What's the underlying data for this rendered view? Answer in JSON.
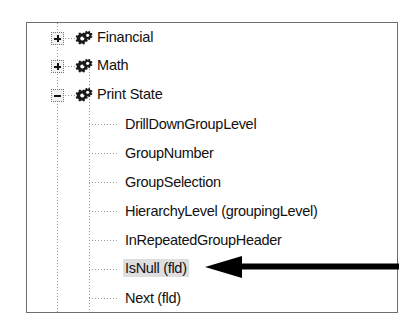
{
  "panel": {
    "name": "function-tree",
    "border_color": "#6e6e6e",
    "background": "#ffffff"
  },
  "tree": {
    "groups": [
      {
        "label": "Financial",
        "expanded": false,
        "expander": "plus",
        "icon": "gear-icon",
        "children": []
      },
      {
        "label": "Math",
        "expanded": false,
        "expander": "plus",
        "icon": "gear-icon",
        "children": []
      },
      {
        "label": "Print State",
        "expanded": true,
        "expander": "minus",
        "icon": "gear-icon",
        "children": [
          {
            "label": "DrillDownGroupLevel",
            "selected": false
          },
          {
            "label": "GroupNumber",
            "selected": false
          },
          {
            "label": "GroupSelection",
            "selected": false
          },
          {
            "label": "HierarchyLevel (groupingLevel)",
            "selected": false
          },
          {
            "label": "InRepeatedGroupHeader",
            "selected": false
          },
          {
            "label": "IsNull (fld)",
            "selected": true
          },
          {
            "label": "Next (fld)",
            "selected": false
          }
        ]
      }
    ]
  },
  "annotation": {
    "arrow": {
      "name": "callout-arrow",
      "direction": "left",
      "color": "#000000",
      "points_at": "IsNull (fld)"
    }
  },
  "colors": {
    "selection_highlight": "#dedede",
    "text": "#111111",
    "guide_line": "#9a9a9a",
    "icon_dark": "#1a1a1a"
  }
}
